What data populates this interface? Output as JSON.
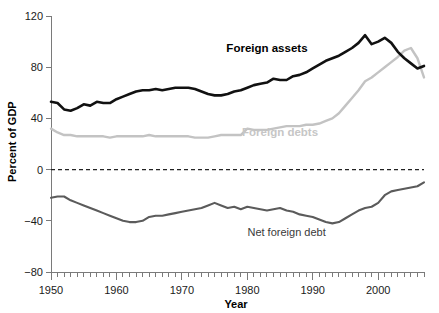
{
  "chart_data": {
    "type": "line",
    "title": "",
    "xlabel": "Year",
    "ylabel": "Percent of GDP",
    "xlim": [
      1950,
      2007
    ],
    "ylim": [
      -80,
      120
    ],
    "yticks": [
      120,
      80,
      40,
      0,
      -40,
      -80
    ],
    "ytick_labels": [
      "120",
      "80",
      "40",
      "0",
      "−40",
      "−80"
    ],
    "xticks": [
      1950,
      1960,
      1970,
      1980,
      1990,
      2000
    ],
    "xtick_labels": [
      "1950",
      "1960",
      "1970",
      "1980",
      "1990",
      "2000"
    ],
    "minor_xtick_interval": 1,
    "grid": false,
    "legend_position": "inline-annotations",
    "zero_reference_line": true,
    "x": [
      1950,
      1951,
      1952,
      1953,
      1954,
      1955,
      1956,
      1957,
      1958,
      1959,
      1960,
      1961,
      1962,
      1963,
      1964,
      1965,
      1966,
      1967,
      1968,
      1969,
      1970,
      1971,
      1972,
      1973,
      1974,
      1975,
      1976,
      1977,
      1978,
      1979,
      1980,
      1981,
      1982,
      1983,
      1984,
      1985,
      1986,
      1987,
      1988,
      1989,
      1990,
      1991,
      1992,
      1993,
      1994,
      1995,
      1996,
      1997,
      1998,
      1999,
      2000,
      2001,
      2002,
      2003,
      2004,
      2005,
      2006,
      2007
    ],
    "series": [
      {
        "name": "Foreign assets",
        "color": "#111111",
        "label_position": {
          "x": 1983,
          "y": 92
        },
        "values": [
          53,
          52,
          47,
          46,
          48,
          51,
          50,
          53,
          52,
          52,
          55,
          57,
          59,
          61,
          62,
          62,
          63,
          62,
          63,
          64,
          64,
          64,
          63,
          61,
          59,
          58,
          58,
          59,
          61,
          62,
          64,
          66,
          67,
          68,
          71,
          70,
          70,
          73,
          74,
          76,
          79,
          82,
          85,
          87,
          89,
          92,
          95,
          99,
          105,
          98,
          100,
          103,
          99,
          92,
          87,
          83,
          79,
          81
        ]
      },
      {
        "name": "Foreign debts",
        "color": "#c3c3c3",
        "label_position": {
          "x": 1985,
          "y": 26
        },
        "values": [
          32,
          29,
          27,
          27,
          26,
          26,
          26,
          26,
          26,
          25,
          26,
          26,
          26,
          26,
          26,
          27,
          26,
          26,
          26,
          26,
          26,
          26,
          25,
          25,
          25,
          26,
          27,
          27,
          27,
          27,
          32,
          31,
          31,
          31,
          32,
          33,
          34,
          34,
          34,
          35,
          35,
          36,
          38,
          40,
          44,
          50,
          56,
          62,
          69,
          72,
          76,
          80,
          84,
          88,
          93,
          95,
          87,
          72
        ]
      },
      {
        "name": "Net foreign debt",
        "color": "#5b5b5b",
        "label_position": {
          "x": 1986,
          "y": -52
        },
        "values": [
          -22,
          -21,
          -21,
          -24,
          -26,
          -28,
          -30,
          -32,
          -34,
          -36,
          -38,
          -40,
          -41,
          -41,
          -40,
          -37,
          -36,
          -36,
          -35,
          -34,
          -33,
          -32,
          -31,
          -30,
          -28,
          -26,
          -28,
          -30,
          -29,
          -31,
          -29,
          -30,
          -31,
          -32,
          -31,
          -30,
          -32,
          -33,
          -35,
          -36,
          -37,
          -39,
          -41,
          -42,
          -41,
          -38,
          -35,
          -32,
          -30,
          -29,
          -26,
          -20,
          -17,
          -16,
          -15,
          -14,
          -13,
          -10
        ]
      }
    ],
    "annotations": [
      {
        "text": "Foreign assets",
        "name": "series-label-foreign-assets"
      },
      {
        "text": "Foreign debts",
        "name": "series-label-foreign-debts"
      },
      {
        "text": "Net foreign debt",
        "name": "series-label-net-foreign-debt"
      }
    ]
  }
}
